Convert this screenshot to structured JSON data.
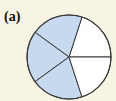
{
  "label": "(a)",
  "chart_data": {
    "type": "pie",
    "title": "(a)",
    "total_sectors": 5,
    "shaded_sectors": 3,
    "fraction_shaded": "3/5",
    "sectors": [
      {
        "index": 0,
        "start_deg": 0,
        "end_deg": 72,
        "shaded": false
      },
      {
        "index": 1,
        "start_deg": 72,
        "end_deg": 144,
        "shaded": true
      },
      {
        "index": 2,
        "start_deg": 144,
        "end_deg": 216,
        "shaded": true
      },
      {
        "index": 3,
        "start_deg": 216,
        "end_deg": 288,
        "shaded": true
      },
      {
        "index": 4,
        "start_deg": 288,
        "end_deg": 360,
        "shaded": false
      }
    ],
    "colors": {
      "shaded": "#c6d9ee",
      "unshaded": "#ffffff",
      "stroke": "#3a3a3a",
      "background": "#f8f4e4"
    }
  }
}
